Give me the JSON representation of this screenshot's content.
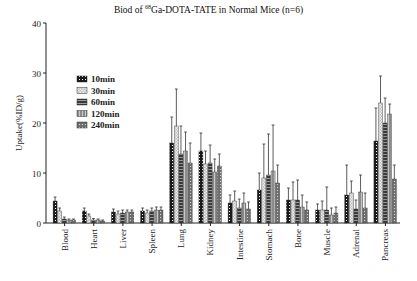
{
  "chart_data": {
    "type": "bar",
    "title": "Biod of 68Ga-DOTA-TATE in Normal Mice (n=6)",
    "title_parts": {
      "prefix": "Biod of ",
      "sup": "68",
      "suffix": "Ga-DOTA-TATE in Normal Mice (n=6)"
    },
    "xlabel": "",
    "ylabel": "Uptake(%ID/g)",
    "ylim": [
      0,
      40
    ],
    "yticks": [
      0,
      10,
      20,
      30,
      40
    ],
    "grid": false,
    "legend_position": "upper-left-inside",
    "categories": [
      "Blood",
      "Heart",
      "Liver",
      "Spleen",
      "Lung",
      "Kidney",
      "Intestine",
      "Stomach",
      "Bone",
      "Muscle",
      "Adrenal",
      "Pancreas"
    ],
    "series": [
      {
        "name": "10min",
        "values": [
          4.4,
          2.4,
          2.2,
          2.4,
          16.0,
          14.4,
          4.0,
          6.6,
          4.6,
          2.6,
          5.6,
          16.4
        ],
        "errors": [
          0.8,
          0.6,
          0.6,
          0.6,
          5.2,
          3.6,
          1.6,
          3.4,
          2.4,
          1.2,
          6.0,
          6.6
        ]
      },
      {
        "name": "30min",
        "values": [
          2.4,
          1.4,
          1.8,
          2.0,
          19.4,
          11.8,
          4.4,
          9.0,
          4.6,
          2.6,
          6.0,
          24.0
        ],
        "errors": [
          0.6,
          0.4,
          0.6,
          0.6,
          7.4,
          2.6,
          2.0,
          6.8,
          3.6,
          1.8,
          2.4,
          5.4
        ]
      },
      {
        "name": "60min",
        "values": [
          0.8,
          0.6,
          2.0,
          2.4,
          13.8,
          12.0,
          3.0,
          9.6,
          4.6,
          2.6,
          2.8,
          20.0
        ],
        "errors": [
          0.4,
          0.3,
          0.6,
          0.6,
          5.6,
          3.6,
          1.8,
          8.2,
          4.0,
          4.6,
          1.8,
          5.0
        ]
      },
      {
        "name": "120min",
        "values": [
          0.6,
          0.6,
          2.2,
          2.6,
          14.4,
          10.2,
          4.0,
          10.4,
          3.2,
          1.6,
          6.2,
          21.8
        ],
        "errors": [
          0.2,
          0.2,
          0.4,
          0.6,
          3.8,
          2.6,
          2.0,
          9.2,
          2.4,
          1.4,
          3.4,
          2.0
        ]
      },
      {
        "name": "240min",
        "values": [
          0.6,
          0.4,
          2.2,
          2.6,
          12.0,
          11.4,
          2.8,
          8.0,
          2.6,
          2.0,
          3.0,
          8.8
        ],
        "errors": [
          0.2,
          0.2,
          0.4,
          0.6,
          4.0,
          2.4,
          1.4,
          3.6,
          1.6,
          1.2,
          3.0,
          2.8
        ]
      }
    ]
  }
}
